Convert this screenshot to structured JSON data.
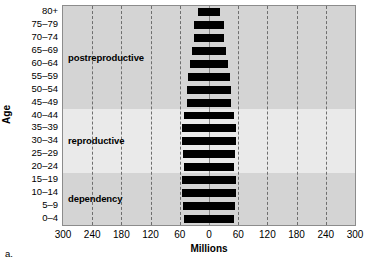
{
  "figure": {
    "panel_caption": "a.",
    "y_axis_title": "Age",
    "x_axis_title": "Millions"
  },
  "chart_data": {
    "type": "bar",
    "subtype": "population-pyramid",
    "title": "",
    "xlabel": "Millions",
    "ylabel": "Age",
    "orientation": "horizontal",
    "grid": true,
    "legend": "none",
    "xlim": [
      -300,
      300
    ],
    "xticks": [
      -300,
      -240,
      -180,
      -120,
      -60,
      0,
      60,
      120,
      180,
      240,
      300
    ],
    "xtick_labels": [
      "300",
      "240",
      "180",
      "120",
      "60",
      "0",
      "60",
      "120",
      "180",
      "240",
      "300"
    ],
    "categories": [
      "80+",
      "75–79",
      "70–74",
      "65–69",
      "60–64",
      "55–59",
      "50–54",
      "45–49",
      "40–44",
      "35–39",
      "30–34",
      "25–29",
      "20–24",
      "15–19",
      "10–14",
      "5–9",
      "0–4"
    ],
    "series": [
      {
        "name": "Male",
        "side": "left",
        "color": "#000000",
        "values": [
          22,
          31,
          30,
          34,
          39,
          43,
          45,
          46,
          51,
          56,
          55,
          53,
          52,
          55,
          55,
          53,
          52
        ]
      },
      {
        "name": "Female",
        "side": "right",
        "color": "#000000",
        "values": [
          22,
          31,
          30,
          34,
          39,
          43,
          45,
          46,
          51,
          56,
          55,
          53,
          52,
          55,
          55,
          53,
          52
        ]
      }
    ],
    "zones": [
      {
        "label": "postreproductive",
        "from_category": "80+",
        "to_category": "45–49",
        "shade": "#d4d4d4"
      },
      {
        "label": "reproductive",
        "from_category": "40–44",
        "to_category": "20–24",
        "shade": "#eaeaea"
      },
      {
        "label": "dependency",
        "from_category": "15–19",
        "to_category": "0–4",
        "shade": "#d4d4d4"
      }
    ]
  }
}
